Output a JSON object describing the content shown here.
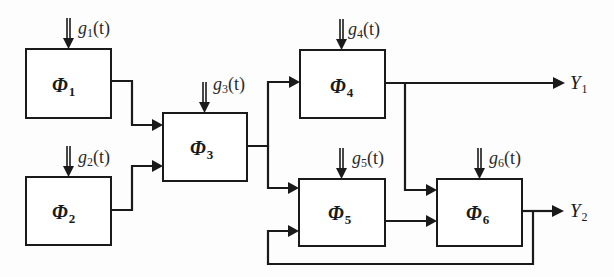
{
  "diagram": {
    "type": "block-diagram",
    "blocks": [
      {
        "id": "phi1",
        "symbol": "Φ",
        "index": "1",
        "input_signal": {
          "symbol": "g",
          "index": "1",
          "arg": "(t)"
        }
      },
      {
        "id": "phi2",
        "symbol": "Φ",
        "index": "2",
        "input_signal": {
          "symbol": "g",
          "index": "2",
          "arg": "(t)"
        }
      },
      {
        "id": "phi3",
        "symbol": "Φ",
        "index": "3",
        "input_signal": {
          "symbol": "g",
          "index": "3",
          "arg": "(t)"
        }
      },
      {
        "id": "phi4",
        "symbol": "Φ",
        "index": "4",
        "input_signal": {
          "symbol": "g",
          "index": "4",
          "arg": "(t)"
        }
      },
      {
        "id": "phi5",
        "symbol": "Φ",
        "index": "5",
        "input_signal": {
          "symbol": "g",
          "index": "5",
          "arg": "(t)"
        }
      },
      {
        "id": "phi6",
        "symbol": "Φ",
        "index": "6",
        "input_signal": {
          "symbol": "g",
          "index": "6",
          "arg": "(t)"
        }
      }
    ],
    "outputs": [
      {
        "id": "y1",
        "symbol": "Y",
        "index": "1",
        "from": "phi4"
      },
      {
        "id": "y2",
        "symbol": "Y",
        "index": "2",
        "from": "phi6"
      }
    ],
    "connections": [
      {
        "from": "phi1",
        "to": "phi3"
      },
      {
        "from": "phi2",
        "to": "phi3"
      },
      {
        "from": "phi3",
        "to": "phi4"
      },
      {
        "from": "phi3",
        "to": "phi5"
      },
      {
        "from": "phi4",
        "to": "y1"
      },
      {
        "from": "phi4",
        "to": "phi6"
      },
      {
        "from": "phi5",
        "to": "phi6"
      },
      {
        "from": "phi6",
        "to": "y2"
      },
      {
        "from": "phi6",
        "to": "phi5",
        "kind": "feedback"
      }
    ]
  }
}
